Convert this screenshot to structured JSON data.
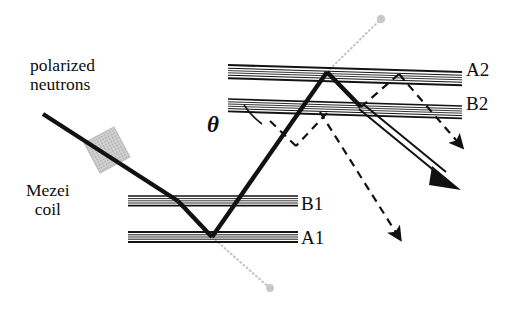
{
  "figure": {
    "kind": "optics-ray-diagram",
    "background_color": "#ffffff",
    "ink_color": "#111111",
    "faint_color": "#b9b9b9",
    "coil_fill": "#c9c9c9",
    "width": 530,
    "height": 310
  },
  "labels": {
    "source_line1": "polarized",
    "source_line2": "neutrons",
    "device_line1": "Mezei",
    "device_line2": "coil",
    "mirror_a1": "A1",
    "mirror_b1": "B1",
    "mirror_a2": "A2",
    "mirror_b2": "B2",
    "angle": "θ"
  },
  "mirrors": [
    {
      "name": "A1",
      "label": "A1",
      "x1": 128,
      "y1": 237,
      "x2": 298,
      "y2": 237,
      "bands": 5,
      "tilt_deg": 0
    },
    {
      "name": "B1",
      "label": "B1",
      "x1": 128,
      "y1": 201,
      "x2": 298,
      "y2": 201,
      "bands": 5,
      "tilt_deg": 0
    },
    {
      "name": "A2",
      "label": "A2",
      "x1": 228,
      "y1": 69,
      "x2": 462,
      "y2": 76,
      "bands": 6,
      "tilt_deg": 1.7
    },
    {
      "name": "B2",
      "label": "B2",
      "x1": 228,
      "y1": 103,
      "x2": 462,
      "y2": 110,
      "bands": 6,
      "tilt_deg": 1.7
    }
  ],
  "beam": {
    "solid_path_points": [
      {
        "x": 43,
        "y": 114
      },
      {
        "x": 178,
        "y": 201
      },
      {
        "x": 212,
        "y": 237
      },
      {
        "x": 327,
        "y": 72
      },
      {
        "x": 361,
        "y": 107
      },
      {
        "x": 452,
        "y": 182
      }
    ],
    "outgoing_is_double_line": true,
    "double_line_gap_px": 4
  },
  "dashed_paths": [
    {
      "name": "dashed-upper-branch",
      "points": [
        {
          "x": 361,
          "y": 107
        },
        {
          "x": 399,
          "y": 74
        },
        {
          "x": 467,
          "y": 152
        }
      ]
    },
    {
      "name": "dashed-lower-branch",
      "points": [
        {
          "x": 327,
          "y": 113
        },
        {
          "x": 295,
          "y": 146
        },
        {
          "x": 268,
          "y": 119
        }
      ]
    },
    {
      "name": "dashed-down-right",
      "points": [
        {
          "x": 318,
          "y": 110
        },
        {
          "x": 404,
          "y": 243
        }
      ]
    }
  ],
  "faint_guides": [
    {
      "name": "faint-guide-top-right",
      "x1": 327,
      "y1": 72,
      "x2": 383,
      "y2": 17
    },
    {
      "name": "faint-guide-bottom-left",
      "x1": 212,
      "y1": 237,
      "x2": 272,
      "y2": 290
    }
  ],
  "coil": {
    "center_x": 107,
    "center_y": 150,
    "width": 34,
    "height": 34,
    "rotation_deg": -28
  },
  "angle_marker": {
    "vertex_x": 327,
    "vertex_y": 72,
    "symbol": "θ"
  }
}
